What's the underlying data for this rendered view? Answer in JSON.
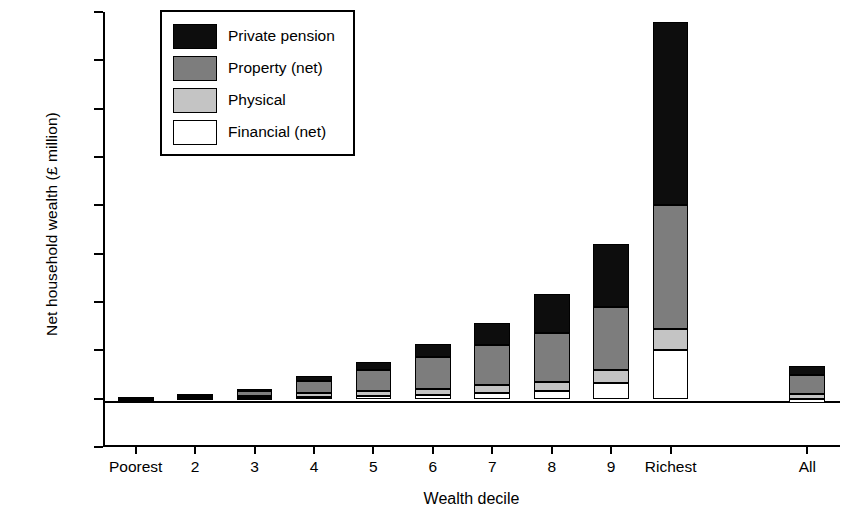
{
  "chart_data": {
    "type": "bar",
    "stacked": true,
    "title": "",
    "xlabel": "Wealth decile",
    "ylabel": "Net household wealth (£ million)",
    "ylim": [
      -0.5,
      4.0
    ],
    "yticks": [
      -0.5,
      0.0,
      0.5,
      1.0,
      1.5,
      2.0,
      2.5,
      3.0,
      3.5,
      4.0
    ],
    "ytick_labels": [
      "−£0.5",
      "£0.0",
      "£0.5",
      "£1.0",
      "£1.5",
      "£2.0",
      "£2.5",
      "£3.0",
      "£3.5",
      "£4.0"
    ],
    "grid": false,
    "legend_position": "top-left-inside",
    "categories": [
      "Poorest",
      "2",
      "3",
      "4",
      "5",
      "6",
      "7",
      "8",
      "9",
      "Richest",
      "All"
    ],
    "series": [
      {
        "name": "Financial (net)",
        "color": "#ffffff",
        "values": [
          -0.005,
          0.005,
          0.01,
          0.02,
          0.03,
          0.04,
          0.06,
          0.08,
          0.16,
          0.5,
          -0.04
        ]
      },
      {
        "name": "Physical",
        "color": "#c4c4c4",
        "values": [
          0.005,
          0.01,
          0.02,
          0.04,
          0.05,
          0.06,
          0.08,
          0.09,
          0.14,
          0.22,
          0.05
        ]
      },
      {
        "name": "Property (net)",
        "color": "#7d7d7d",
        "values": [
          0.005,
          0.02,
          0.05,
          0.12,
          0.22,
          0.33,
          0.42,
          0.51,
          0.65,
          1.28,
          0.19
        ]
      },
      {
        "name": "Private pension",
        "color": "#0d0d0d",
        "values": [
          0.005,
          0.01,
          0.02,
          0.05,
          0.08,
          0.14,
          0.22,
          0.4,
          0.65,
          1.9,
          0.1
        ]
      }
    ],
    "totals": [
      0.01,
      0.04,
      0.1,
      0.23,
      0.38,
      0.57,
      0.78,
      1.08,
      1.6,
      3.9,
      0.3
    ]
  },
  "legend": {
    "items": [
      {
        "label": "Private pension",
        "key": "pension"
      },
      {
        "label": "Property (net)",
        "key": "property"
      },
      {
        "label": "Physical",
        "key": "physical"
      },
      {
        "label": "Financial (net)",
        "key": "financial"
      }
    ]
  }
}
